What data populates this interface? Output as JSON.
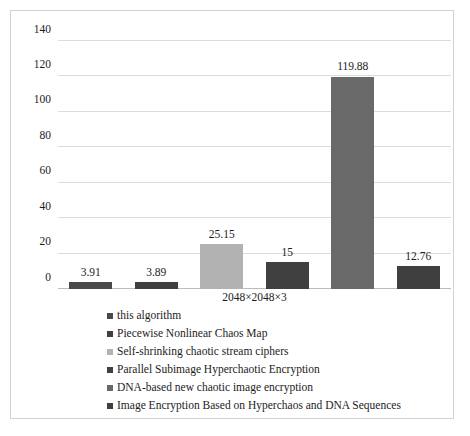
{
  "chart_data": {
    "type": "bar",
    "title": "",
    "xlabel": "",
    "ylabel": "",
    "categories": [
      "2048×2048×3"
    ],
    "ylim": [
      0,
      140
    ],
    "yticks": [
      "0",
      "20",
      "40",
      "60",
      "80",
      "100",
      "120",
      "140"
    ],
    "ytick_values": [
      0,
      20,
      40,
      60,
      80,
      100,
      120,
      140
    ],
    "grid": true,
    "legend_position": "bottom-left",
    "data_labels": [
      "3.91",
      "3.89",
      "25.15",
      "15",
      "119.88",
      "12.76"
    ],
    "series": [
      {
        "name": "this algorithm",
        "values": [
          3.91
        ],
        "color": "#4a4a4a"
      },
      {
        "name": "Piecewise Nonlinear Chaos Map",
        "values": [
          3.89
        ],
        "color": "#3f3f3f"
      },
      {
        "name": "Self-shrinking chaotic stream ciphers",
        "values": [
          25.15
        ],
        "color": "#b2b2b2"
      },
      {
        "name": "Parallel Subimage Hyperchaotic Encryption",
        "values": [
          15
        ],
        "color": "#404040"
      },
      {
        "name": "DNA-based new chaotic image encryption",
        "values": [
          119.88
        ],
        "color": "#696969"
      },
      {
        "name": "Image Encryption Based on Hyperchaos and DNA Sequences",
        "values": [
          12.76
        ],
        "color": "#3f3f3f"
      }
    ]
  }
}
